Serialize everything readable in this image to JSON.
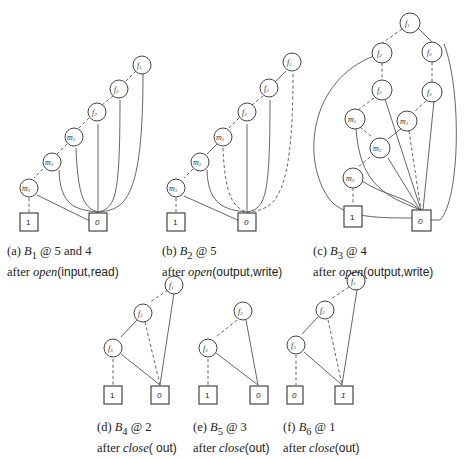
{
  "panels": [
    {
      "id": "a",
      "label": "(a)",
      "bdd": "B",
      "sub": "1",
      "at": "@ 5 and 4",
      "after": "after",
      "op": "open",
      "args": "(input,read)",
      "nodes": [
        "f1",
        "f2",
        "f3",
        "m1",
        "m2",
        "m3"
      ],
      "terminals": [
        "1",
        "0"
      ]
    },
    {
      "id": "b",
      "label": "(b)",
      "bdd": "B",
      "sub": "2",
      "at": "@ 5",
      "after": "after",
      "op": "open",
      "args": "(output,write)",
      "nodes": [
        "f1",
        "f2",
        "f3",
        "m1",
        "m2",
        "m3"
      ],
      "terminals": [
        "1",
        "0"
      ]
    },
    {
      "id": "c",
      "label": "(c)",
      "bdd": "B",
      "sub": "3",
      "at": "@ 4",
      "after": "after",
      "op": "open",
      "args": "(output,write)",
      "nodes": [
        "f1",
        "f2",
        "f2",
        "f3",
        "f3",
        "m1",
        "m1",
        "m2",
        "m3"
      ],
      "terminals": [
        "1",
        "0"
      ]
    },
    {
      "id": "d",
      "label": "(d)",
      "bdd": "B",
      "sub": "4",
      "at": "@ 2",
      "after": "after",
      "op": "close",
      "args": "( out)",
      "nodes": [
        "f1",
        "f2",
        "f3"
      ],
      "terminals": [
        "1",
        "0"
      ]
    },
    {
      "id": "e",
      "label": "(e)",
      "bdd": "B",
      "sub": "5",
      "at": "@ 3",
      "after": "after",
      "op": "close",
      "args": "(out)",
      "nodes": [
        "f2",
        "f3"
      ],
      "terminals": [
        "1",
        "0"
      ]
    },
    {
      "id": "f",
      "label": "(f)",
      "bdd": "B",
      "sub": "6",
      "at": "@ 1",
      "after": "after",
      "op": "close",
      "args": "(out)",
      "nodes": [
        "f1",
        "f2",
        "f3"
      ],
      "terminals": [
        "0",
        "1"
      ]
    }
  ],
  "labels": {
    "f": "f",
    "m": "m"
  }
}
